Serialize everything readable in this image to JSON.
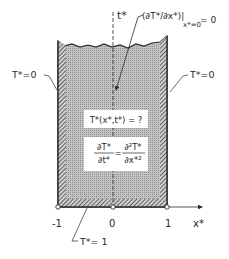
{
  "diagram": {
    "axis": {
      "time_label": "t*",
      "x_label": "x*",
      "ticks": [
        {
          "label": "-1",
          "value": -1
        },
        {
          "label": "0",
          "value": 0
        },
        {
          "label": "1",
          "value": 1
        }
      ]
    },
    "boundary_conditions": {
      "left": "T*=0",
      "right": "T*=0",
      "bottom": "T*= 1",
      "symmetry_main": "(∂T*/∂x*)|",
      "symmetry_sub": "x*=0",
      "symmetry_eq": "= 0"
    },
    "unknown_box": {
      "text": "T*(x*,t*) = ?"
    },
    "equation_box": {
      "lhs_num": "∂T*",
      "lhs_den": "∂t*",
      "equals": "=",
      "rhs_num": "∂²T*",
      "rhs_den": "∂x*²"
    },
    "colors": {
      "fill": "#b8b8b8",
      "hatch": "#3a3a3a",
      "line": "#2a2a2a",
      "background": "#ffffff"
    }
  }
}
